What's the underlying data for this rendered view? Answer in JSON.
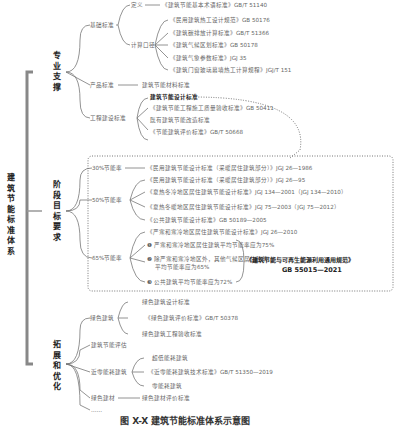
{
  "root": {
    "title": "建筑节能标准体系"
  },
  "branches": [
    {
      "title": "专业支撑",
      "children": [
        {
          "label": "基础标准",
          "children": [
            {
              "label": "定义",
              "items": [
                "《建筑节能基本术语标准》GB/T 51140"
              ]
            },
            {
              "label": "计算口径",
              "items": [
                "《民用建筑热工设计规范》GB 50176",
                "《建筑碳排放计算标准》GB/T 51366",
                "《建筑气候区划标准》GB 50178",
                "《建筑气象参数标准》JGJ 35",
                "《建筑门窗玻璃幕墙热工计算规程》JGJ/T 151"
              ]
            }
          ]
        },
        {
          "label": "产品标准",
          "items": [
            "建筑节能材料标准"
          ]
        },
        {
          "label": "工程建设标准",
          "items": [
            "建筑节能设计标准",
            "《建筑节能工程施工质量验收标准》GB 50411",
            "既有建筑节能改造标准",
            "《节能建筑评价标准》GB/T 50668"
          ]
        }
      ]
    },
    {
      "title": "阶段目标要求",
      "children": [
        {
          "label": "30%节能率",
          "items": [
            "《民用建筑节能设计标准（采暖居住建筑部分）》JGJ 26—1986"
          ]
        },
        {
          "label": "50%节能率",
          "items": [
            "《民用建筑节能设计标准（采暖居住建筑部分）》JGJ 26—95",
            "《夏热冬冷地区居住建筑节能设计标准》JGJ 134—2001（JGJ 134—2010）",
            "《夏热冬暖地区居住建筑节能设计标准》JGJ 75—2003（JGJ 75—2012）",
            "《公共建筑节能设计标准》GB 50189—2005"
          ]
        },
        {
          "label": "65%节能率",
          "items": [
            "《严寒和寒冷地区居住建筑节能设计标准》JGJ 26—2010",
            "❶ 严寒和寒冷地区居住建筑平均节能率应为75%",
            "❷ 除严寒和寒冷地区外，其他气候区居住建筑",
            "平均节能率应为65%",
            "❸ 公共建筑平均节能率应为72%"
          ]
        }
      ],
      "callout": {
        "title": "《建筑节能与可再生能源利用通用规范》",
        "code": "GB 55015—2021"
      }
    },
    {
      "title": "拓展和优化",
      "children": [
        {
          "label": "绿色建筑",
          "items": [
            "绿色建筑设计标准",
            "《绿色建筑评价标准》GB/T 50378",
            "绿色建筑工程验收标准"
          ]
        },
        {
          "label": "建筑节能评估"
        },
        {
          "label": "近零能耗建筑",
          "items": [
            "超低能耗建筑",
            "《近零能耗建筑技术标准》GB/T 51350—2019",
            "零能耗建筑"
          ]
        },
        {
          "label": "绿色建材",
          "items": [
            "绿色建材评价标准"
          ]
        },
        {
          "label": "……"
        }
      ]
    }
  ],
  "caption": "图 X-X  建筑节能标准体系示意图"
}
